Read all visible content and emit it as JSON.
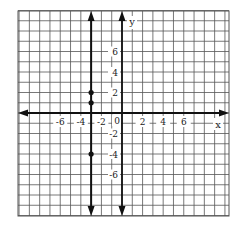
{
  "chart_data": {
    "type": "line",
    "title": "",
    "xlabel": "x",
    "ylabel": "y",
    "xlim": [
      -10,
      10
    ],
    "ylim": [
      -10,
      10
    ],
    "grid": true,
    "x_tick_labels": [
      "-6",
      "-4",
      "-2",
      "2",
      "4",
      "6"
    ],
    "x_ticks": [
      -6,
      -4,
      -2,
      2,
      4,
      6
    ],
    "y_tick_labels": [
      "6",
      "4",
      "2",
      "-2",
      "-4",
      "-6"
    ],
    "y_ticks": [
      6,
      4,
      2,
      -2,
      -4,
      -6
    ],
    "origin_label": "0",
    "series": [
      {
        "name": "x = -3",
        "type": "vertical-line",
        "x": -3,
        "points": [
          {
            "x": -3,
            "y": 2
          },
          {
            "x": -3,
            "y": 1
          },
          {
            "x": -3,
            "y": -4
          }
        ]
      }
    ]
  },
  "colors": {
    "grid": "#555555",
    "axis": "#111111",
    "line": "#111111",
    "background": "#ffffff"
  }
}
